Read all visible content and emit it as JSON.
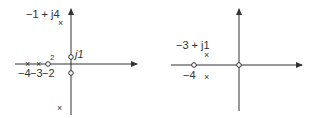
{
  "diagrams": [
    {
      "name": "left-pole-zero-plot",
      "labels": {
        "complex_pole": "−1 + j4",
        "imag_zero": "j1",
        "multiplicity": "2",
        "tick_m4": "−4",
        "tick_m3": "−3",
        "tick_m2": "−2"
      },
      "markers": {
        "pole": "×",
        "zero": "○"
      }
    },
    {
      "name": "right-pole-zero-plot",
      "labels": {
        "complex_pole": "−3 + j1",
        "tick_m4": "−4"
      },
      "markers": {
        "pole": "×"
      }
    }
  ],
  "colors": {
    "ink": "#333333",
    "background": "#ffffff"
  }
}
